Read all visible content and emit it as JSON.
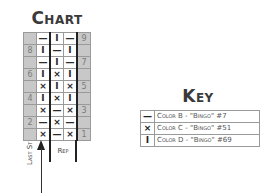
{
  "chart": {
    "title": "Chart",
    "rows": [
      {
        "left": "",
        "cells": [
          "—",
          "I",
          "—"
        ],
        "right": "9"
      },
      {
        "left": "8",
        "cells": [
          "I",
          "—",
          "I"
        ],
        "right": ""
      },
      {
        "left": "",
        "cells": [
          "—",
          "I",
          "—"
        ],
        "right": "7"
      },
      {
        "left": "6",
        "cells": [
          "I",
          "×",
          "I"
        ],
        "right": ""
      },
      {
        "left": "",
        "cells": [
          "×",
          "I",
          "×"
        ],
        "right": "5"
      },
      {
        "left": "4",
        "cells": [
          "I",
          "×",
          "I"
        ],
        "right": ""
      },
      {
        "left": "",
        "cells": [
          "×",
          "—",
          "×"
        ],
        "right": "3"
      },
      {
        "left": "2",
        "cells": [
          "—",
          "×",
          "—"
        ],
        "right": ""
      },
      {
        "left": "",
        "cells": [
          "×",
          "—",
          "×"
        ],
        "right": "1"
      }
    ],
    "rep_label": "Rep",
    "last_st_label": "Last St"
  },
  "key": {
    "title": "Key",
    "items": [
      {
        "symbol": "—",
        "label": "Color B - \"Bingo\" #7"
      },
      {
        "symbol": "×",
        "label": "Color C - \"Bingo\" #51"
      },
      {
        "symbol": "I",
        "label": "Color D - \"Bingo\" #69"
      }
    ]
  }
}
